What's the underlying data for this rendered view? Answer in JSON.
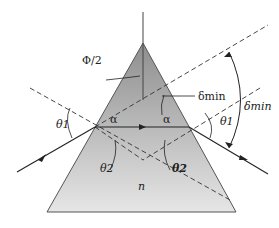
{
  "diagram": {
    "labels": {
      "apex_angle": "Φ/2",
      "delta_min_inner": "δmin",
      "delta_min_outer": "δmin",
      "theta1_left": "θ1",
      "theta1_right": "θ1",
      "theta2_left": "θ2",
      "theta2_right": "θ2",
      "alpha_left": "α",
      "alpha_right": "α",
      "index": "n"
    },
    "colors": {
      "prism_top": "#9a9a9a",
      "prism_bottom": "#e4e4e4",
      "line": "#333333"
    }
  }
}
